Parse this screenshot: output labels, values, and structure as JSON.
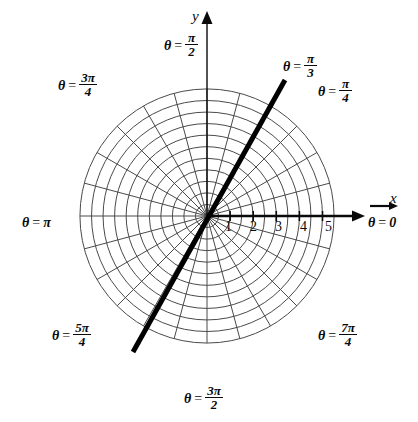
{
  "figure": {
    "type": "polar-grid-diagram",
    "background_color": "#ffffff",
    "ink_color": "#0a0a0a",
    "grid_color": "#4a4a4a"
  },
  "axes": {
    "x_axis_label": "x",
    "y_axis_label": "y",
    "radial_tick_labels": [
      "1",
      "2",
      "3",
      "4",
      "5"
    ],
    "radial_tick_values": [
      1,
      2,
      3,
      4,
      5
    ],
    "r_max": 5.5
  },
  "angle_labels": [
    {
      "id": "theta-0",
      "theta_text": "θ",
      "eq": "=",
      "value_plain": "0",
      "num": "",
      "den": "",
      "degrees": 0
    },
    {
      "id": "theta-pi-4",
      "theta_text": "θ",
      "eq": "=",
      "value_plain": "",
      "num": "π",
      "den": "4",
      "degrees": 45
    },
    {
      "id": "theta-pi-3",
      "theta_text": "θ",
      "eq": "=",
      "value_plain": "",
      "num": "π",
      "den": "3",
      "degrees": 60
    },
    {
      "id": "theta-pi-2",
      "theta_text": "θ",
      "eq": "=",
      "value_plain": "",
      "num": "π",
      "den": "2",
      "degrees": 90
    },
    {
      "id": "theta-3pi-4",
      "theta_text": "θ",
      "eq": "=",
      "value_plain": "",
      "num": "3π",
      "den": "4",
      "degrees": 135
    },
    {
      "id": "theta-pi",
      "theta_text": "θ",
      "eq": "=",
      "value_plain": "π",
      "num": "",
      "den": "",
      "degrees": 180
    },
    {
      "id": "theta-5pi-4",
      "theta_text": "θ",
      "eq": "=",
      "value_plain": "",
      "num": "5π",
      "den": "4",
      "degrees": 225
    },
    {
      "id": "theta-3pi-2",
      "theta_text": "θ",
      "eq": "=",
      "value_plain": "",
      "num": "3π",
      "den": "2",
      "degrees": 270
    },
    {
      "id": "theta-7pi-4",
      "theta_text": "θ",
      "eq": "=",
      "value_plain": "",
      "num": "7π",
      "den": "4",
      "degrees": 315
    }
  ],
  "chart_data": {
    "type": "line",
    "title": "",
    "coordinate_system": "polar",
    "center_px": {
      "x": 207,
      "y": 216
    },
    "px_per_unit": 23.1,
    "grid": {
      "circles_r": [
        0.5,
        1,
        1.5,
        2,
        2.5,
        3,
        3.5,
        4,
        4.5,
        5,
        5.5
      ],
      "major_circles_r": [
        1,
        2,
        3,
        4,
        5
      ],
      "spokes_deg": [
        0,
        15,
        30,
        45,
        60,
        75,
        90,
        105,
        120,
        135,
        150,
        165,
        180,
        195,
        210,
        225,
        240,
        255,
        270,
        285,
        300,
        315,
        330,
        345
      ],
      "spoke_step_deg": 15,
      "grid_on": true,
      "legend": "none"
    },
    "series": [
      {
        "name": "theta = pi/3 line",
        "equation_theta_deg": 60,
        "style": "thick-solid",
        "color": "#000000",
        "width_px": 5,
        "endpoints_px": [
          {
            "x": 285,
            "y": 80
          },
          {
            "x": 133,
            "y": 352
          }
        ],
        "r_range": [
          -3.9,
          3.4
        ]
      }
    ],
    "xlabel": "x",
    "ylabel": "y"
  }
}
